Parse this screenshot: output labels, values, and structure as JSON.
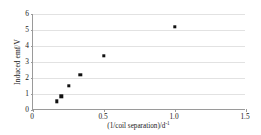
{
  "chart_data": {
    "type": "scatter",
    "title": "",
    "xlabel": "(1/coil separation)/d",
    "xlabel_exponent": "-1",
    "ylabel": "Induced emf/V",
    "xlim": [
      0,
      1.5
    ],
    "ylim": [
      0,
      6
    ],
    "xticks": [
      "0",
      "0.5",
      "1.0",
      "1.5"
    ],
    "xtick_values": [
      0,
      0.5,
      1.0,
      1.5
    ],
    "yticks": [
      "0",
      "1",
      "2",
      "3",
      "4",
      "5",
      "6"
    ],
    "ytick_values": [
      0,
      1,
      2,
      3,
      4,
      5,
      6
    ],
    "grid": "horizontal",
    "legend": null,
    "marker": "filled-square",
    "marker_color": "#111111",
    "points": [
      {
        "x": 0.167,
        "y": 0.55
      },
      {
        "x": 0.2,
        "y": 0.85
      },
      {
        "x": 0.25,
        "y": 1.5
      },
      {
        "x": 0.333,
        "y": 2.2
      },
      {
        "x": 0.5,
        "y": 3.4
      },
      {
        "x": 1.0,
        "y": 5.2
      }
    ]
  }
}
